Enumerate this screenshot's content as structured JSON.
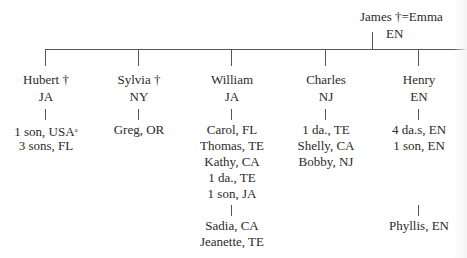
{
  "parents": {
    "label": "James †=Emma",
    "location": "EN"
  },
  "children": [
    {
      "name": "Hubert †",
      "location": "JA",
      "descendants": [
        "1 son, USA",
        "3 sons, FL"
      ],
      "footnote_mark": "a"
    },
    {
      "name": "Sylvia †",
      "location": "NY",
      "descendants": [
        "Greg, OR"
      ]
    },
    {
      "name": "William",
      "location": "JA",
      "descendants": [
        "Carol, FL",
        "Thomas, TE",
        "Kathy, CA",
        "1 da., TE",
        "1 son, JA"
      ],
      "grand_descendants": [
        "Sadia, CA",
        "Jeanette, TE"
      ]
    },
    {
      "name": "Charles",
      "location": "NJ",
      "descendants": [
        "1 da., TE",
        "Shelly, CA",
        "Bobby, NJ"
      ]
    },
    {
      "name": "Henry",
      "location": "EN",
      "descendants": [
        "4 da.s, EN",
        "1 son, EN"
      ],
      "grand_descendants": [
        "Phyllis, EN"
      ]
    }
  ]
}
